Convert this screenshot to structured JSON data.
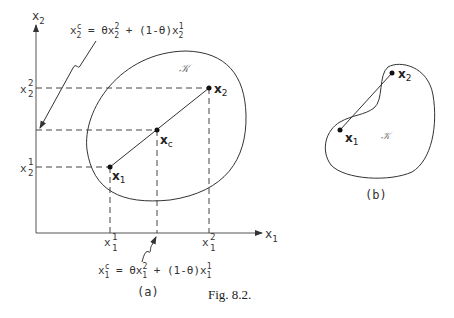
{
  "figure": {
    "caption": "Fig. 8.2.",
    "panel_a": {
      "label": "(a)",
      "x_axis_label": "x",
      "x_axis_sub": "1",
      "y_axis_label": "x",
      "y_axis_sub": "2",
      "set_label": "𝒦",
      "points": {
        "x1": {
          "name": "x",
          "sub": "1"
        },
        "x2": {
          "name": "x",
          "sub": "2"
        },
        "xc": {
          "name": "x",
          "sub": "c"
        }
      },
      "ticks": {
        "x1_1": {
          "base": "x",
          "sup": "1",
          "sub": "1"
        },
        "x1_2": {
          "base": "x",
          "sup": "2",
          "sub": "1"
        },
        "x2_1": {
          "base": "x",
          "sup": "1",
          "sub": "2"
        },
        "x2_2": {
          "base": "x",
          "sup": "2",
          "sub": "2"
        }
      },
      "formula_top": {
        "lhs": "x",
        "lhs_sup": "c",
        "lhs_sub": "2",
        "eq": " = θx",
        "t1_sup": "2",
        "t1_sub": "2",
        "mid": " + (1-θ)x",
        "t2_sup": "1",
        "t2_sub": "2"
      },
      "formula_bottom": {
        "lhs": "x",
        "lhs_sup": "c",
        "lhs_sub": "1",
        "eq": " = θx",
        "t1_sup": "2",
        "t1_sub": "1",
        "mid": " + (1-θ)x",
        "t2_sup": "1",
        "t2_sub": "1"
      }
    },
    "panel_b": {
      "label": "(b)",
      "set_label": "𝒦",
      "points": {
        "x1": {
          "name": "x",
          "sub": "1"
        },
        "x2": {
          "name": "x",
          "sub": "2"
        }
      }
    },
    "colors": {
      "line": "#333333",
      "dash": "#444444",
      "text": "#333333"
    }
  }
}
